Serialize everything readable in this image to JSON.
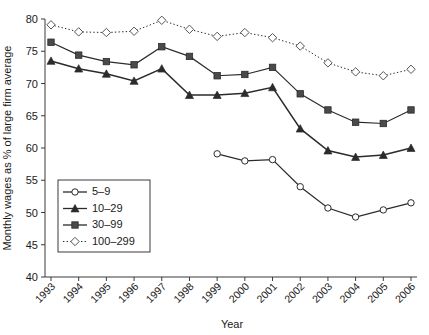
{
  "chart_data": {
    "type": "line",
    "title": "",
    "xlabel": "Year",
    "ylabel": "Monthly wages as % of large firm average",
    "categories": [
      "1993",
      "1994",
      "1995",
      "1996",
      "1997",
      "1998",
      "1999",
      "2000",
      "2001",
      "2002",
      "2003",
      "2004",
      "2005",
      "2006"
    ],
    "x": [
      1993,
      1994,
      1995,
      1996,
      1997,
      1998,
      1999,
      2000,
      2001,
      2002,
      2003,
      2004,
      2005,
      2006
    ],
    "ylim": [
      40,
      80
    ],
    "yticks": [
      40,
      45,
      50,
      55,
      60,
      65,
      70,
      75,
      80
    ],
    "grid": false,
    "legend_position": "lower-left-inside",
    "series": [
      {
        "name": "5–9",
        "marker": "open-circle",
        "linestyle": "solid",
        "color": "#2b2b2b",
        "values": [
          null,
          null,
          null,
          null,
          null,
          null,
          59.1,
          58.0,
          58.2,
          54.0,
          50.7,
          49.3,
          50.4,
          51.5
        ]
      },
      {
        "name": "10–29",
        "marker": "filled-triangle",
        "linestyle": "solid",
        "color": "#2b2b2b",
        "values": [
          73.5,
          72.3,
          71.5,
          70.4,
          72.3,
          68.2,
          68.2,
          68.5,
          69.4,
          63.0,
          59.6,
          58.6,
          58.9,
          60.0
        ]
      },
      {
        "name": "30–99",
        "marker": "filled-square",
        "linestyle": "solid",
        "color": "#2b2b2b",
        "values": [
          76.4,
          74.4,
          73.4,
          72.9,
          75.7,
          74.2,
          71.2,
          71.4,
          72.5,
          68.4,
          65.9,
          64.0,
          63.8,
          65.9
        ]
      },
      {
        "name": "100–299",
        "marker": "open-diamond",
        "linestyle": "dotted",
        "color": "#555555",
        "values": [
          79.1,
          78.0,
          77.9,
          78.1,
          79.8,
          78.4,
          77.3,
          77.9,
          77.1,
          75.8,
          73.2,
          71.8,
          71.2,
          72.2
        ]
      }
    ]
  }
}
